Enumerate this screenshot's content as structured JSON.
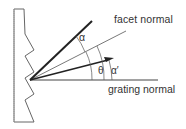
{
  "diagram": {
    "type": "blazed grating geometry",
    "labels": {
      "facet_normal": "facet  normal",
      "grating_normal": "grating normal",
      "alpha": "α",
      "theta": "θ",
      "alpha_prime": "α′"
    },
    "elements": {
      "grating": "sawtooth grating profile (side view)",
      "incident_ray": "thick line at angle α from facet normal",
      "facet_normal_line": "thin line at blaze angle θ from grating normal",
      "diffracted_ray": "arrow at angle α′ from grating normal",
      "grating_normal_line": "horizontal line"
    },
    "colors": {
      "stroke": "#2a2a2a",
      "thin_stroke": "#555555",
      "background": "#ffffff"
    }
  }
}
